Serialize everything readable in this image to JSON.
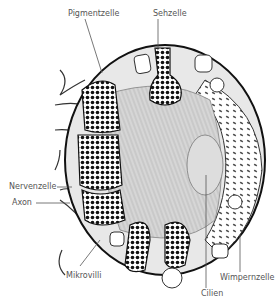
{
  "labels": {
    "pigmentzelle": "Pigmentzelle",
    "sehzelle": "Sehzelle",
    "nervenzelle": "Nervenzelle",
    "axon": "Axon",
    "mikrovilli": "Mikrovilli",
    "cilien": "Cilien",
    "wimpernzelle": "Wimpernzelle"
  }
}
